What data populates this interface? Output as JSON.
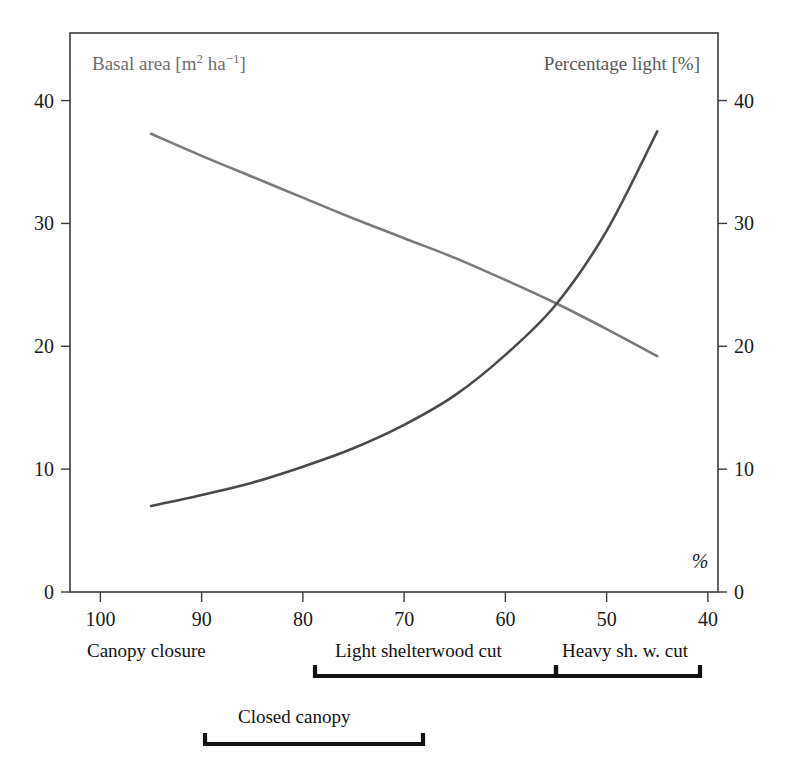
{
  "chart_data": {
    "type": "line",
    "title": "",
    "xlabel": "Canopy closure [%]",
    "x_axis": {
      "ticks": [
        100,
        90,
        80,
        70,
        60,
        50,
        40
      ],
      "tick_labels": [
        "100",
        "90",
        "80",
        "70",
        "60",
        "50",
        "40"
      ],
      "min": 103,
      "max": 39,
      "direction": "descending",
      "unit_marker": "%"
    },
    "y_axis_left": {
      "label": "Basal area [m² ha⁻¹]",
      "label_parts": {
        "name": "Basal area",
        "unit_open": "[m",
        "unit_sup1": "2",
        "unit_mid": " ha",
        "unit_sup2": "−1",
        "unit_close": "]"
      },
      "ticks": [
        0,
        10,
        20,
        30,
        40
      ],
      "tick_labels": [
        "0",
        "10",
        "20",
        "30",
        "40"
      ],
      "min": 0,
      "max": 45.5
    },
    "y_axis_right": {
      "label": "Percentage light [%]",
      "ticks": [
        0,
        10,
        20,
        30,
        40
      ],
      "tick_labels": [
        "0",
        "10",
        "20",
        "30",
        "40"
      ],
      "min": 0,
      "max": 45.5
    },
    "grid": false,
    "legend": "none",
    "series": [
      {
        "name": "Basal area",
        "axis": "left",
        "color": "#7a7a7a",
        "x": [
          95,
          90,
          85,
          80,
          75,
          70,
          65,
          60,
          55,
          50,
          45
        ],
        "values": [
          37.3,
          35.5,
          33.8,
          32.1,
          30.4,
          28.8,
          27.2,
          25.4,
          23.5,
          21.4,
          19.2
        ]
      },
      {
        "name": "Percentage light",
        "axis": "right",
        "color": "#4a4a4a",
        "x": [
          95,
          90,
          85,
          80,
          75,
          70,
          65,
          60,
          55,
          50,
          45
        ],
        "values": [
          7.0,
          7.9,
          8.9,
          10.2,
          11.7,
          13.6,
          16.0,
          19.3,
          23.4,
          29.4,
          37.5
        ]
      }
    ],
    "annotations": [
      {
        "text": "%",
        "x_px": 700,
        "y_px": 568
      }
    ],
    "category_bands": [
      {
        "label": "Canopy closure",
        "label_x_px": 87,
        "label_y_px": 657,
        "bracket": false
      },
      {
        "label": "Light shelterwood cut",
        "label_x_px": 335,
        "label_y_px": 657,
        "bracket": true,
        "bracket_x1_px": 315,
        "bracket_x2_px": 556,
        "bracket_y_px": 676
      },
      {
        "label": "Heavy sh. w. cut",
        "label_x_px": 562,
        "label_y_px": 657,
        "bracket": true,
        "bracket_x1_px": 556,
        "bracket_x2_px": 700,
        "bracket_y_px": 676
      },
      {
        "label": "Closed canopy",
        "label_x_px": 238,
        "label_y_px": 723,
        "bracket": true,
        "bracket_x1_px": 205,
        "bracket_x2_px": 423,
        "bracket_y_px": 744
      }
    ]
  },
  "colors": {
    "basal_area_curve": "#7a7a7a",
    "percentage_light_curve": "#4a4a4a",
    "frame": "#3c3c3c",
    "text": "#1a1a1a",
    "label_gray": "#6e6e6e",
    "background": "#ffffff"
  }
}
